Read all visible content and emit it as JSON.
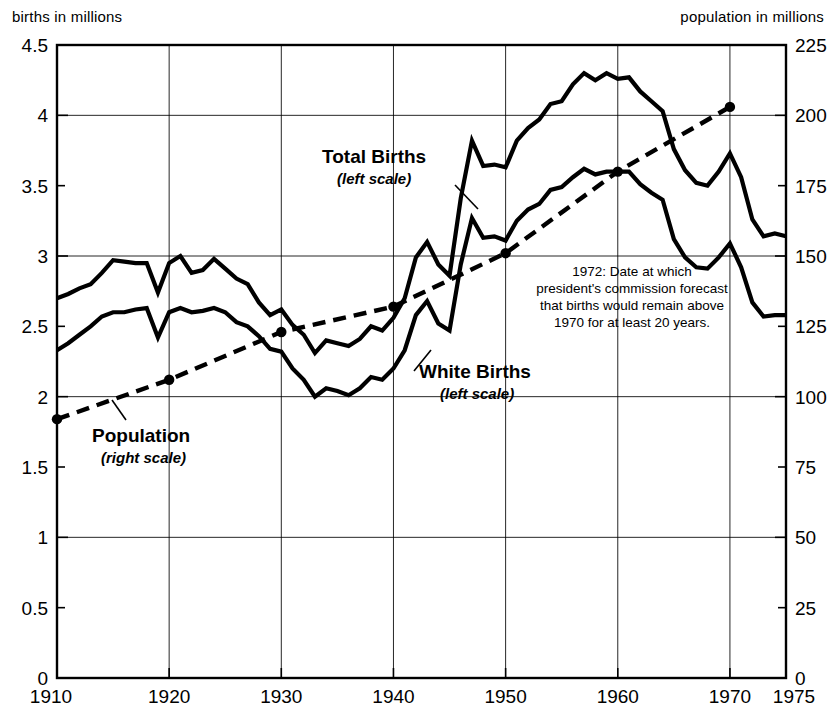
{
  "chart_data": {
    "type": "line",
    "title": "",
    "xlabel": "",
    "ylabel": "births in millions",
    "y2label": "population in millions",
    "xlim": [
      1910,
      1975
    ],
    "ylim": [
      0,
      4.5
    ],
    "y2lim": [
      0,
      225
    ],
    "grid": true,
    "legend_position": "inline-annotations",
    "xticks": [
      1910,
      1920,
      1930,
      1940,
      1950,
      1960,
      1970,
      1975
    ],
    "xticklabels": [
      "1910",
      "1920",
      "1930",
      "1940",
      "1950",
      "1960",
      "1970",
      "1975"
    ],
    "yticks": [
      0,
      0.5,
      1,
      1.5,
      2,
      2.5,
      3,
      3.5,
      4,
      4.5
    ],
    "yticklabels": [
      "0",
      "0.5",
      "1",
      "1.5",
      "2",
      "2.5",
      "3",
      "3.5",
      "4",
      "4.5"
    ],
    "y2ticks": [
      0,
      25,
      50,
      75,
      100,
      125,
      150,
      175,
      200,
      225
    ],
    "y2ticklabels": [
      "0",
      "25",
      "50",
      "75",
      "100",
      "125",
      "150",
      "175",
      "200",
      "225"
    ],
    "series": [
      {
        "name": "Total Births",
        "axis": "left",
        "style": "solid",
        "x": [
          1910,
          1911,
          1912,
          1913,
          1914,
          1915,
          1916,
          1917,
          1918,
          1919,
          1920,
          1921,
          1922,
          1923,
          1924,
          1925,
          1926,
          1927,
          1928,
          1929,
          1930,
          1931,
          1932,
          1933,
          1934,
          1935,
          1936,
          1937,
          1938,
          1939,
          1940,
          1941,
          1942,
          1943,
          1944,
          1945,
          1946,
          1947,
          1948,
          1949,
          1950,
          1951,
          1952,
          1953,
          1954,
          1955,
          1956,
          1957,
          1958,
          1959,
          1960,
          1961,
          1962,
          1963,
          1964,
          1965,
          1966,
          1967,
          1968,
          1969,
          1970,
          1971,
          1972,
          1973,
          1974,
          1975
        ],
        "values": [
          2.7,
          2.73,
          2.77,
          2.8,
          2.88,
          2.97,
          2.96,
          2.95,
          2.95,
          2.74,
          2.95,
          3.0,
          2.88,
          2.9,
          2.98,
          2.91,
          2.84,
          2.8,
          2.67,
          2.58,
          2.62,
          2.51,
          2.44,
          2.31,
          2.4,
          2.38,
          2.36,
          2.41,
          2.5,
          2.47,
          2.56,
          2.7,
          2.99,
          3.1,
          2.94,
          2.86,
          3.41,
          3.82,
          3.64,
          3.65,
          3.63,
          3.82,
          3.91,
          3.97,
          4.08,
          4.1,
          4.22,
          4.3,
          4.25,
          4.3,
          4.26,
          4.27,
          4.17,
          4.1,
          4.03,
          3.76,
          3.61,
          3.52,
          3.5,
          3.6,
          3.73,
          3.56,
          3.26,
          3.14,
          3.16,
          3.14
        ],
        "peak": {
          "year": 1957,
          "value": 4.3
        },
        "trough_1930s": {
          "year": 1933,
          "value": 2.31
        }
      },
      {
        "name": "White Births",
        "axis": "left",
        "style": "solid",
        "x": [
          1910,
          1911,
          1912,
          1913,
          1914,
          1915,
          1916,
          1917,
          1918,
          1919,
          1920,
          1921,
          1922,
          1923,
          1924,
          1925,
          1926,
          1927,
          1928,
          1929,
          1930,
          1931,
          1932,
          1933,
          1934,
          1935,
          1936,
          1937,
          1938,
          1939,
          1940,
          1941,
          1942,
          1943,
          1944,
          1945,
          1946,
          1947,
          1948,
          1949,
          1950,
          1951,
          1952,
          1953,
          1954,
          1955,
          1956,
          1957,
          1958,
          1959,
          1960,
          1961,
          1962,
          1963,
          1964,
          1965,
          1966,
          1967,
          1968,
          1969,
          1970,
          1971,
          1972,
          1973,
          1974,
          1975
        ],
        "values": [
          2.33,
          2.38,
          2.44,
          2.5,
          2.57,
          2.6,
          2.6,
          2.62,
          2.63,
          2.42,
          2.6,
          2.63,
          2.6,
          2.61,
          2.63,
          2.6,
          2.53,
          2.5,
          2.43,
          2.34,
          2.32,
          2.2,
          2.12,
          2.0,
          2.06,
          2.04,
          2.01,
          2.06,
          2.14,
          2.12,
          2.2,
          2.33,
          2.58,
          2.68,
          2.52,
          2.47,
          2.94,
          3.27,
          3.13,
          3.14,
          3.11,
          3.25,
          3.33,
          3.37,
          3.47,
          3.49,
          3.56,
          3.62,
          3.58,
          3.6,
          3.6,
          3.6,
          3.51,
          3.45,
          3.4,
          3.12,
          2.99,
          2.92,
          2.91,
          2.99,
          3.09,
          2.92,
          2.67,
          2.57,
          2.58,
          2.58
        ],
        "peak": {
          "year": 1957,
          "value": 3.62
        },
        "trough_1930s": {
          "year": 1933,
          "value": 2.0
        }
      },
      {
        "name": "Population",
        "axis": "right",
        "style": "dashed",
        "x": [
          1910,
          1920,
          1930,
          1940,
          1950,
          1960,
          1970
        ],
        "values": [
          92,
          106,
          123,
          132,
          151,
          180,
          203
        ],
        "markers": [
          1910,
          1920,
          1930,
          1940,
          1950,
          1960,
          1970
        ]
      }
    ],
    "annotations": [
      {
        "id": "total-births",
        "label": "Total Births",
        "sublabel": "(left scale)",
        "scale": "left"
      },
      {
        "id": "white-births",
        "label": "White Births",
        "sublabel": "(left scale)",
        "scale": "left"
      },
      {
        "id": "population",
        "label": "Population",
        "sublabel": "(right scale)",
        "scale": "right"
      },
      {
        "id": "forecast-note",
        "lines": [
          "1972: Date at which",
          "president's commission forecast",
          "that births would remain above",
          "1970 for at least 20 years."
        ]
      }
    ]
  },
  "axes": {
    "left_caption": "births in millions",
    "right_caption": "population in millions"
  },
  "labels": {
    "total_births": "Total Births",
    "total_births_sub": "(left scale)",
    "white_births": "White Births",
    "white_births_sub": "(left scale)",
    "population": "Population",
    "population_sub": "(right scale)"
  },
  "note": {
    "line1": "1972: Date at which",
    "line2": "president's commission forecast",
    "line3": "that births would remain above",
    "line4": "1970 for at least 20 years."
  },
  "colors": {
    "ink": "#000000",
    "background": "#ffffff",
    "grid": "#000000"
  }
}
